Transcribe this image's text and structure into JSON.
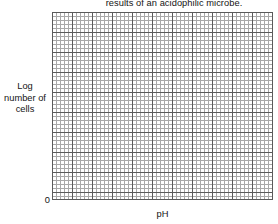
{
  "figure": {
    "title": "results of an acidophilic microbe.",
    "background_color": "#ffffff",
    "text_color": "#141414"
  },
  "axes": {
    "y_label_lines": [
      "Log",
      "number of",
      "cells"
    ],
    "x_label": "pH",
    "origin_label": "0"
  },
  "chart_data": {
    "type": "line",
    "title": "results of an acidophilic microbe.",
    "subtitle": "",
    "xlabel": "pH",
    "ylabel": "Log number of cells",
    "series": [
      {
        "name": "",
        "x": [],
        "values": []
      }
    ],
    "x": [],
    "categories": [],
    "values": [],
    "xlim": [
      0,
      0
    ],
    "ylim": [
      0,
      0
    ],
    "x_tick_labels": [
      "0"
    ],
    "y_tick_labels": [],
    "annotations": [],
    "legend": [],
    "legend_position": "none",
    "grid": true,
    "grid_style": {
      "minor_spacing_px": 4,
      "major_spacing_px": 20,
      "minor_color": "#a8a8a8",
      "major_color": "#5a5a5a"
    },
    "note": "Blank graph-paper plotting grid; no data curve is drawn."
  }
}
